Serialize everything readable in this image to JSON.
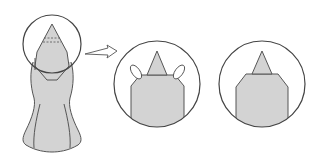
{
  "diagram": {
    "type": "origami-folding-steps",
    "colors": {
      "paper": "#d3d3d3",
      "outline": "#555555",
      "circle": "#444444",
      "background": "#ffffff"
    },
    "steps": [
      {
        "name": "full-figure",
        "description": "Full folded figure with head tip circled; dashed fold lines near the tip"
      },
      {
        "name": "zoom-detail-fold",
        "description": "Magnified head: side flaps folded behind, indicated by loop arrows"
      },
      {
        "name": "zoom-detail-result",
        "description": "Magnified head: result after folding"
      }
    ],
    "arrow": {
      "name": "zoom-arrow",
      "description": "Hollow arrow pointing from the full figure's circle to the magnified view"
    }
  }
}
